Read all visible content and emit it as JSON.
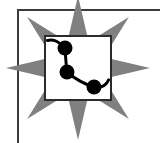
{
  "canvas": {
    "width": 160,
    "height": 143,
    "background": "#ffffff"
  },
  "frame": {
    "name": "document-border-frame",
    "stroke": "#3c3c3c",
    "stroke_width": 2,
    "corner_x": 17,
    "corner_y": 9,
    "description": "thin dark rule forming the top and left edges of a page frame, running off the right and bottom edges"
  },
  "starburst": {
    "name": "eight-point-star-burst",
    "fill": "#808080",
    "points": 8,
    "center_x": 78,
    "center_y": 68,
    "outer_radius": 72,
    "inner_radius": 28,
    "rotation_deg": 0
  },
  "panel": {
    "name": "chart-panel",
    "x": 44,
    "y": 35,
    "width": 68,
    "height": 66,
    "fill": "#ffffff",
    "stroke": "#2b2b2b",
    "stroke_width": 2
  },
  "chart_data": {
    "type": "line",
    "title": "",
    "subtitle": "",
    "xlabel": "",
    "ylabel": "",
    "xlim": [
      0,
      100
    ],
    "ylim": [
      0,
      100
    ],
    "grid": false,
    "legend": false,
    "legend_position": "none",
    "marker": "circle",
    "marker_radius": 7,
    "marker_color": "#000000",
    "line_color": "#000000",
    "line_width": 3,
    "tick_labels_x": [],
    "tick_labels_y": [],
    "annotations": [],
    "series": [
      {
        "name": "series-1",
        "x": [
          2,
          31,
          34,
          74,
          100
        ],
        "y": [
          92,
          80,
          44,
          24,
          36
        ],
        "values": [
          92,
          80,
          44,
          24,
          36
        ],
        "points_px": [
          {
            "x": 48,
            "y": 40,
            "marker": false
          },
          {
            "x": 65,
            "y": 48,
            "marker": true
          },
          {
            "x": 67,
            "y": 72,
            "marker": true
          },
          {
            "x": 94,
            "y": 87,
            "marker": true
          },
          {
            "x": 108,
            "y": 80,
            "marker": false
          }
        ]
      }
    ],
    "path_d": "M 47.5 40.5 C 53 38.5 60 42 65 48 C 65.5 56 66 64 67 72 C 74 78 84 84 94 87 C 101 88 106 86 108.5 80"
  },
  "labels": {
    "app_title": "",
    "alt_text": "Line chart panel over an eight-pointed star burst"
  }
}
